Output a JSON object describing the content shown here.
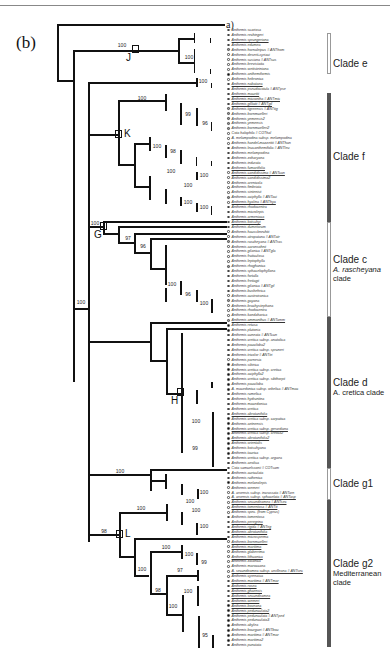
{
  "figure": {
    "panel_label": "(b)",
    "outgroup_label": "a)"
  },
  "nodes": [
    {
      "letter": "J",
      "x": 135,
      "y": 49
    },
    {
      "letter": "K",
      "x": 118,
      "y": 134
    },
    {
      "letter": "G",
      "x": 103,
      "y": 226
    },
    {
      "letter": "H",
      "x": 180,
      "y": 392
    },
    {
      "letter": "L",
      "x": 119,
      "y": 534
    }
  ],
  "bootstrap": [
    {
      "v": "100",
      "x": 122,
      "y": 48
    },
    {
      "v": "100",
      "x": 189,
      "y": 60
    },
    {
      "v": "100",
      "x": 203,
      "y": 84
    },
    {
      "v": "100",
      "x": 142,
      "y": 101
    },
    {
      "v": "99",
      "x": 188,
      "y": 117
    },
    {
      "v": "96",
      "x": 205,
      "y": 126
    },
    {
      "v": "100",
      "x": 157,
      "y": 149
    },
    {
      "v": "98",
      "x": 173,
      "y": 154
    },
    {
      "v": "100",
      "x": 171,
      "y": 174
    },
    {
      "v": "100",
      "x": 204,
      "y": 178
    },
    {
      "v": "100",
      "x": 188,
      "y": 188
    },
    {
      "v": "100",
      "x": 188,
      "y": 205
    },
    {
      "v": "100",
      "x": 204,
      "y": 210
    },
    {
      "v": "100",
      "x": 95,
      "y": 226
    },
    {
      "v": "97",
      "x": 128,
      "y": 241
    },
    {
      "v": "96",
      "x": 143,
      "y": 249
    },
    {
      "v": "100",
      "x": 172,
      "y": 287
    },
    {
      "v": "96",
      "x": 188,
      "y": 297
    },
    {
      "v": "100",
      "x": 204,
      "y": 306
    },
    {
      "v": "100",
      "x": 81,
      "y": 305
    },
    {
      "v": "100",
      "x": 196,
      "y": 424
    },
    {
      "v": "99",
      "x": 195,
      "y": 451
    },
    {
      "v": "100",
      "x": 120,
      "y": 474
    },
    {
      "v": "100",
      "x": 204,
      "y": 495
    },
    {
      "v": "100",
      "x": 141,
      "y": 511
    },
    {
      "v": "100",
      "x": 190,
      "y": 504
    },
    {
      "v": "100",
      "x": 196,
      "y": 513
    },
    {
      "v": "100",
      "x": 204,
      "y": 529
    },
    {
      "v": "98",
      "x": 104,
      "y": 534
    },
    {
      "v": "100",
      "x": 166,
      "y": 550
    },
    {
      "v": "100",
      "x": 189,
      "y": 557
    },
    {
      "v": "99",
      "x": 204,
      "y": 565
    },
    {
      "v": "100",
      "x": 142,
      "y": 572
    },
    {
      "v": "97",
      "x": 180,
      "y": 573
    },
    {
      "v": "98",
      "x": 158,
      "y": 593
    },
    {
      "v": "100",
      "x": 188,
      "y": 594
    },
    {
      "v": "100",
      "x": 173,
      "y": 609
    },
    {
      "v": "95",
      "x": 205,
      "y": 638
    }
  ],
  "clades": [
    {
      "name": "Clade e",
      "sub": [],
      "style": "light",
      "top": 33,
      "bottom": 74,
      "label_y": 58
    },
    {
      "name": "Clade f",
      "sub": [],
      "style": "dark",
      "top": 93,
      "bottom": 222,
      "label_y": 151
    },
    {
      "name": "Clade c",
      "sub": [
        "A. rascheyana",
        "clade"
      ],
      "style": "light",
      "top": 222,
      "bottom": 317,
      "label_y": 254,
      "sub_italic": [
        true,
        false
      ]
    },
    {
      "name": "Clade d",
      "sub": [
        "A. cretica clade"
      ],
      "style": "dark",
      "top": 317,
      "bottom": 468,
      "label_y": 377,
      "sub_italic": [
        false
      ]
    },
    {
      "name": "Clade g1",
      "sub": [],
      "style": "light",
      "top": 468,
      "bottom": 500,
      "label_y": 478
    },
    {
      "name": "Clade g2",
      "sub": [
        "Mediterranean",
        "clade"
      ],
      "style": "dark",
      "top": 500,
      "bottom": 647,
      "label_y": 558,
      "sub_italic": [
        false,
        false
      ]
    }
  ],
  "taxa": [
    {
      "n": "Anthemis scariosa",
      "m": "open"
    },
    {
      "n": "Anthemis rechingeri",
      "m": "open"
    },
    {
      "n": "Anthemis sprungeriana",
      "m": "open",
      "u": true
    },
    {
      "n": "Anthemis edumea",
      "m": "open"
    },
    {
      "n": "Anthemis hornaleipus # ANThom",
      "m": "grey"
    },
    {
      "n": "Anthemis deserti-syriaci",
      "m": "open"
    },
    {
      "n": "Anthemis susiana # ANTsus",
      "m": "open"
    },
    {
      "n": "Anthemis brevistaita",
      "m": "open"
    },
    {
      "n": "Anthemis wettsteiniana",
      "m": "open"
    },
    {
      "n": "Anthemis anthemiformis",
      "m": "filled"
    },
    {
      "n": "Anthemis hebronica",
      "m": "open"
    },
    {
      "n": "Anthemis nabataea",
      "m": "open",
      "u": true
    },
    {
      "n": "Anthemis pseudocotula # ANTpse",
      "m": "grey"
    },
    {
      "n": "Anthemis mauritii",
      "m": "grey",
      "u": true
    },
    {
      "n": "Anthemis micrantha # ANTmic",
      "m": "grey",
      "u": true
    },
    {
      "n": "Anthemis gilliatii # ANTgil",
      "m": "grey",
      "u": true
    },
    {
      "n": "Anthemis tigreensis # ANTtig",
      "m": "grey"
    },
    {
      "n": "Anthemis bornmuelleri",
      "m": "grey"
    },
    {
      "n": "Anthemis yemensis2",
      "m": "grey"
    },
    {
      "n": "Anthemis yemensis",
      "m": "grey"
    },
    {
      "n": "Anthemis bornmuelleri2",
      "m": "grey"
    },
    {
      "n": "Cota halophila # COThal",
      "m": "open"
    },
    {
      "n": "A. melampodina subsp. melampodina",
      "m": "open"
    },
    {
      "n": "Anthemis handel-mazzettii # ANThan",
      "m": "open"
    },
    {
      "n": "Anthemis leucanthemifolia # ANTleu",
      "m": "open"
    },
    {
      "n": "Anthemis melampodina",
      "m": "open"
    },
    {
      "n": "Anthemis zoharyana",
      "m": "open"
    },
    {
      "n": "Anthemis indurata",
      "m": "open"
    },
    {
      "n": "Anthemis fumariifolia",
      "m": "open",
      "u": true
    },
    {
      "n": "Anthemis candidissima # ANTcan",
      "m": "open",
      "u": true
    },
    {
      "n": "Anthemis candidissima2",
      "m": "open"
    },
    {
      "n": "Anthemis arenicola",
      "m": "open"
    },
    {
      "n": "Anthemis fimbriata",
      "m": "open"
    },
    {
      "n": "Anthemis sintenisii",
      "m": "open"
    },
    {
      "n": "Anthemis aciphylla # ANTaci",
      "m": "grey"
    },
    {
      "n": "Anthemis hyalina # ANThya",
      "m": "open",
      "u": true
    },
    {
      "n": "Anthemis rhodocentra",
      "m": "open"
    },
    {
      "n": "Anthemis microlepis",
      "m": "open"
    },
    {
      "n": "Anthemis armeniaca",
      "m": "open",
      "u": true
    },
    {
      "n": "Anthemis kotschyi",
      "m": "open",
      "u": true
    },
    {
      "n": "Anthemis dumetorum",
      "m": "open"
    },
    {
      "n": "Anthemis haussknechtii",
      "m": "open"
    },
    {
      "n": "Anthemis atropatana # ANTatr",
      "m": "open"
    },
    {
      "n": "Anthemis rascheyana # ANTras",
      "m": "grey"
    },
    {
      "n": "Anthemis aaronsohnii",
      "m": "open"
    },
    {
      "n": "Anthemis gilanica # ANTgla",
      "m": "open"
    },
    {
      "n": "Anthemis fruticulosa",
      "m": "open"
    },
    {
      "n": "Anthemis leptophylla",
      "m": "open"
    },
    {
      "n": "Anthemis rhoghanica",
      "m": "grey"
    },
    {
      "n": "Anthemis sphacelophyllana",
      "m": "open"
    },
    {
      "n": "Anthemis fortalla",
      "m": "open"
    },
    {
      "n": "Anthemis freitagii",
      "m": "open"
    },
    {
      "n": "Anthemis gilanica # ANTgil",
      "m": "grey"
    },
    {
      "n": "Anthemis bushehrica",
      "m": "open"
    },
    {
      "n": "Anthemis austroiranica",
      "m": "open"
    },
    {
      "n": "Anthemis gayana",
      "m": "grey"
    },
    {
      "n": "Anthemis brachystephana",
      "m": "open"
    },
    {
      "n": "Anthemis rhodocentra",
      "m": "open"
    },
    {
      "n": "Anthemis kandaharica",
      "m": "open"
    },
    {
      "n": "Anthemis ammanthus # ANTamm",
      "m": "grey",
      "u": true
    },
    {
      "n": "Anthemis retusa",
      "m": "filled"
    },
    {
      "n": "Anthemis plutonia",
      "m": "filled"
    },
    {
      "n": "Anthemis cuneata # ANTcun",
      "m": "filled"
    },
    {
      "n": "Anthemis cretica subsp. anatolica",
      "m": "filled"
    },
    {
      "n": "Anthemis pauciloba2",
      "m": "filled"
    },
    {
      "n": "Anthemis cretica subsp. spruneri",
      "m": "filled"
    },
    {
      "n": "Anthemis tricolor # ANTtri",
      "m": "filled"
    },
    {
      "n": "Anthemis parnesia",
      "m": "open"
    },
    {
      "n": "Anthemis sibirica",
      "m": "filled"
    },
    {
      "n": "Anthemis cretica subsp. cretica",
      "m": "filled"
    },
    {
      "n": "Anthemis aciphylla2",
      "m": "filled"
    },
    {
      "n": "Anthemis cretica subsp. sibthorpii",
      "m": "filled"
    },
    {
      "n": "Anthemis pauciloba",
      "m": "filled"
    },
    {
      "n": "A. macedonica subsp. orbelica # ANTmac",
      "m": "filled"
    },
    {
      "n": "Anthemis rumelica",
      "m": "filled"
    },
    {
      "n": "Anthemis hydruntina",
      "m": "filled"
    },
    {
      "n": "Anthemis macedonica",
      "m": "filled"
    },
    {
      "n": "Anthemis cretica",
      "m": "filled"
    },
    {
      "n": "Anthemis abrotanifolia",
      "m": "filled",
      "u": true
    },
    {
      "n": "Anthemis cretica subsp. carpatica",
      "m": "filled"
    },
    {
      "n": "Anthemis aetnensis",
      "m": "filled"
    },
    {
      "n": "Anthemis cretica subsp. gerardiana",
      "m": "filled",
      "u": true
    },
    {
      "n": "Anthemis cretica subsp. cretica2",
      "m": "filled"
    },
    {
      "n": "Anthemis abrotanifolia2",
      "m": "filled",
      "u": true
    },
    {
      "n": "Anthemis orientalis",
      "m": "filled"
    },
    {
      "n": "Anthemis kotschyana",
      "m": "filled"
    },
    {
      "n": "Anthemis taurica",
      "m": "filled"
    },
    {
      "n": "Anthemis cretica subsp. argaea",
      "m": "filled"
    },
    {
      "n": "Anthemis aeolica",
      "m": "filled"
    },
    {
      "n": "Cota samuelssonii # COTsam",
      "m": "open"
    },
    {
      "n": "Anthemis auriculata",
      "m": "open"
    },
    {
      "n": "Anthemis ruthenica",
      "m": "open"
    },
    {
      "n": "Anthemis melanolepis",
      "m": "filled"
    },
    {
      "n": "Anthemis werneri",
      "m": "open"
    },
    {
      "n": "A. arvensis subsp. incrassata # ANTarn",
      "m": "open"
    },
    {
      "n": "A. arvensis subsp. sphacelata # ANTasp",
      "m": "open",
      "u": true
    },
    {
      "n": "Anthemis secundiramea # ANTsec",
      "m": "open",
      "u": true
    },
    {
      "n": "Anthemis tomentosa # ANTtt",
      "m": "open",
      "u": true
    },
    {
      "n": "Anthemis spec. (from Cyprus)",
      "m": "open"
    },
    {
      "n": "Anthemis tomentosa",
      "m": "open"
    },
    {
      "n": "Anthemis peregrina",
      "m": "open",
      "u": true
    },
    {
      "n": "Anthemis rigida # ANTrig",
      "m": "open",
      "u": true
    },
    {
      "n": "Anthemis abrotanifolia",
      "m": "open",
      "u": true
    },
    {
      "n": "Anthemis microsperma",
      "m": "open"
    },
    {
      "n": "Anthemis bornmuelleri",
      "m": "open",
      "u": true
    },
    {
      "n": "Anthemis maritima",
      "m": "open",
      "u": true
    },
    {
      "n": "Anthemis glaberrima",
      "m": "open"
    },
    {
      "n": "Anthemis lithuanica",
      "m": "open",
      "u": true
    },
    {
      "n": "Anthemis zaianica",
      "m": "open"
    },
    {
      "n": "Anthemis maroccana",
      "m": "open"
    },
    {
      "n": "A. secundiramea subsp. urvilleana # ANTsec",
      "m": "open",
      "u": true
    },
    {
      "n": "Anthemis cyrenaica",
      "m": "open"
    },
    {
      "n": "Anthemis maritima # ANTmar",
      "m": "open",
      "u": true
    },
    {
      "n": "Anthemis rosea",
      "m": "open",
      "u": true
    },
    {
      "n": "Anthemis ghaensis",
      "m": "open",
      "u": true
    },
    {
      "n": "Anthemis secundiramea",
      "m": "open",
      "u": true
    },
    {
      "n": "Anthemis werneri",
      "m": "open",
      "u": true
    },
    {
      "n": "Anthemis boveana",
      "m": "filled",
      "u": true
    },
    {
      "n": "Anthemis pedunculata2",
      "m": "filled",
      "u": true
    },
    {
      "n": "Anthemis pedunculata # ANTped",
      "m": "filled"
    },
    {
      "n": "Anthemis pedunculata3",
      "m": "filled"
    },
    {
      "n": "Anthemis abylea",
      "m": "filled"
    },
    {
      "n": "Anthemis bourgaei # ANTbou",
      "m": "filled"
    },
    {
      "n": "Anthemis maritima # ANTmar",
      "m": "filled"
    },
    {
      "n": "Anthemis maritima2",
      "m": "filled"
    },
    {
      "n": "Anthemis punctata",
      "m": "filled"
    }
  ]
}
